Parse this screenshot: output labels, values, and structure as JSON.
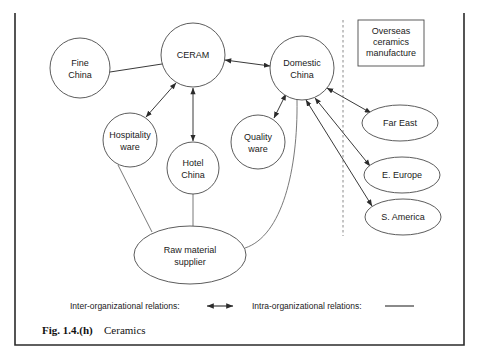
{
  "figure": {
    "caption_label": "Fig. 1.4.(h)",
    "caption_title": "Ceramics"
  },
  "diagram": {
    "type": "network-diagram",
    "nodes": [
      {
        "id": "fine-china",
        "label_line1": "Fine",
        "label_line2": "China",
        "shape": "circle",
        "cx": 80,
        "cy": 68,
        "rx": 30,
        "ry": 30
      },
      {
        "id": "ceram",
        "label_line1": "CERAM",
        "label_line2": "",
        "shape": "circle",
        "cx": 193,
        "cy": 55,
        "rx": 32,
        "ry": 32
      },
      {
        "id": "domestic-china",
        "label_line1": "Domestic",
        "label_line2": "China",
        "shape": "circle",
        "cx": 302,
        "cy": 68,
        "rx": 32,
        "ry": 32
      },
      {
        "id": "hospitality-ware",
        "label_line1": "Hospitality",
        "label_line2": "ware",
        "shape": "circle",
        "cx": 130,
        "cy": 140,
        "rx": 27,
        "ry": 27
      },
      {
        "id": "hotel-china",
        "label_line1": "Hotel",
        "label_line2": "China",
        "shape": "circle",
        "cx": 193,
        "cy": 168,
        "rx": 26,
        "ry": 26
      },
      {
        "id": "quality-ware",
        "label_line1": "Quality",
        "label_line2": "ware",
        "shape": "circle",
        "cx": 258,
        "cy": 142,
        "rx": 27,
        "ry": 27
      },
      {
        "id": "raw-material-supplier",
        "label_line1": "Raw material",
        "label_line2": "supplier",
        "shape": "ellipse",
        "cx": 190,
        "cy": 255,
        "rx": 56,
        "ry": 29
      },
      {
        "id": "far-east",
        "label_line1": "Far East",
        "label_line2": "",
        "shape": "ellipse",
        "cx": 400,
        "cy": 123,
        "rx": 38,
        "ry": 18
      },
      {
        "id": "e-europe",
        "label_line1": "E. Europe",
        "label_line2": "",
        "shape": "ellipse",
        "cx": 402,
        "cy": 175,
        "rx": 38,
        "ry": 18
      },
      {
        "id": "s-america",
        "label_line1": "S. America",
        "label_line2": "",
        "shape": "ellipse",
        "cx": 403,
        "cy": 217,
        "rx": 38,
        "ry": 18
      }
    ],
    "boundary_box": {
      "id": "overseas-ceramics-manufacture",
      "label_line1": "Overseas",
      "label_line2": "ceramics",
      "label_line3": "manufacture"
    },
    "divider": {
      "id": "overseas-divider",
      "style": "dashed",
      "orientation": "vertical"
    }
  },
  "legend": {
    "inter_label": "Inter-organizational relations:",
    "intra_label": "Intra-organizational relations:"
  }
}
